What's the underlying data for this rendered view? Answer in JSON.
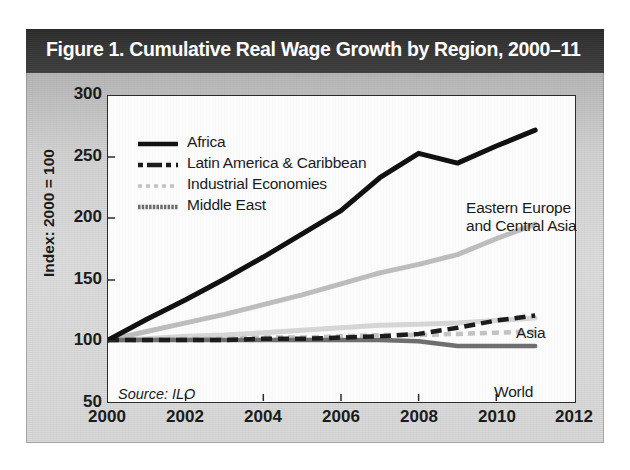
{
  "figure": {
    "title": "Figure 1. Cumulative Real Wage Growth by Region, 2000–11",
    "source_note": "Source: ILO"
  },
  "legend": {
    "items": [
      {
        "label": "Africa",
        "style": "solid",
        "color": "#111111",
        "width": 4
      },
      {
        "label": "Latin America & Caribbean",
        "style": "dashed",
        "color": "#1c1c1c",
        "width": 4
      },
      {
        "label": "Industrial Economies",
        "style": "dotted",
        "color": "#c3c3c3",
        "width": 3.5
      },
      {
        "label": "Middle East",
        "style": "solid",
        "color": "#6e6e6e",
        "width": 4
      }
    ]
  },
  "annotations": [
    {
      "name": "eastern-europe-central-asia",
      "line1": "Eastern Europe",
      "line2": "and Central Asia"
    },
    {
      "name": "asia",
      "text": "Asia"
    },
    {
      "name": "world",
      "text": "World"
    }
  ],
  "chart_data": {
    "type": "line",
    "title": "Figure 1. Cumulative Real Wage Growth by Region, 2000–11",
    "xlabel": "",
    "ylabel": "Index: 2000 = 100",
    "xlim": [
      2000,
      2012
    ],
    "ylim": [
      50,
      300
    ],
    "xticks": [
      2000,
      2002,
      2004,
      2006,
      2008,
      2010,
      2012
    ],
    "yticks": [
      50,
      100,
      150,
      200,
      250,
      300
    ],
    "grid": false,
    "legend_position": "upper-left-inside",
    "x": [
      2000,
      2001,
      2002,
      2003,
      2004,
      2005,
      2006,
      2007,
      2008,
      2009,
      2010,
      2011
    ],
    "series": [
      {
        "name": "Eastern Europe and Central Asia",
        "legend_name": "Africa",
        "style": "solid",
        "color": "#111111",
        "labeled_in_plot": "Eastern Europe and Central Asia",
        "values": [
          100,
          117,
          133,
          150,
          168,
          187,
          206,
          233,
          253,
          245,
          259,
          272
        ]
      },
      {
        "name": "Asia",
        "style": "solid",
        "color": "#bdbdbd",
        "labeled_in_plot": "Asia",
        "values": [
          100,
          107,
          114,
          121,
          129,
          137,
          146,
          155,
          162,
          170,
          183,
          195
        ]
      },
      {
        "name": "World",
        "style": "solid",
        "color": "#d6d6d6",
        "labeled_in_plot": "World",
        "values": [
          100,
          101,
          103,
          104,
          106,
          108,
          110,
          112,
          113,
          114,
          116,
          118
        ]
      },
      {
        "name": "Latin America & Caribbean",
        "style": "dashed",
        "color": "#1c1c1c",
        "labeled_in_plot": "",
        "values": [
          100,
          100,
          100,
          100,
          101,
          101,
          102,
          103,
          105,
          110,
          116,
          120
        ]
      },
      {
        "name": "Industrial Economies",
        "style": "dotted",
        "color": "#c3c3c3",
        "labeled_in_plot": "",
        "values": [
          100,
          100,
          101,
          101,
          102,
          102,
          103,
          104,
          104,
          105,
          106,
          107
        ]
      },
      {
        "name": "Middle East",
        "style": "solid",
        "color": "#6e6e6e",
        "labeled_in_plot": "",
        "values": [
          100,
          100,
          100,
          100,
          100,
          100,
          100,
          100,
          99,
          95,
          95,
          95
        ]
      }
    ]
  }
}
